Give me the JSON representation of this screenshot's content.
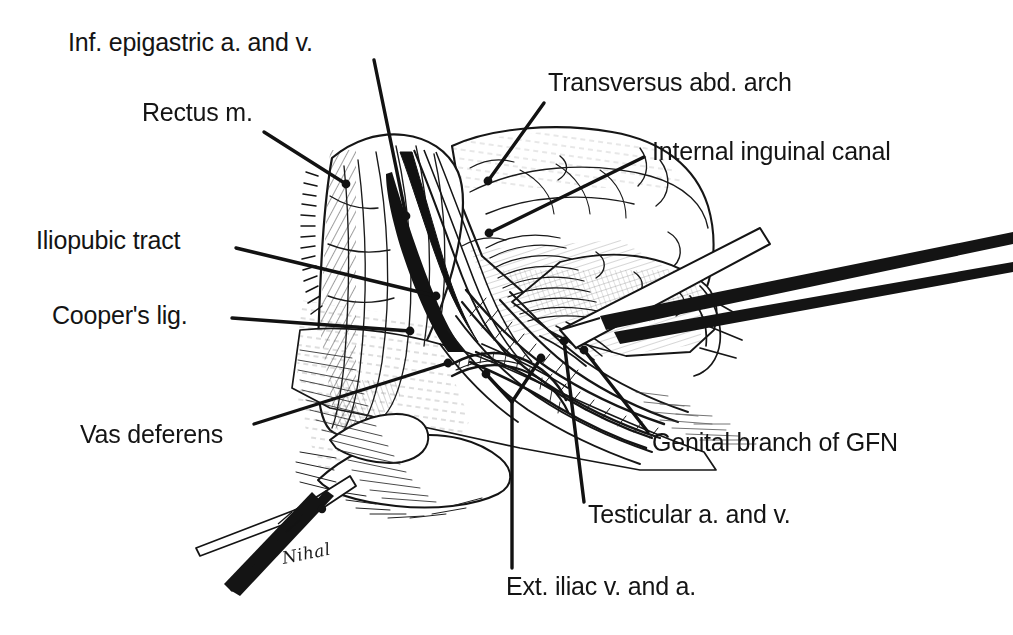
{
  "figure": {
    "type": "anatomical-line-illustration",
    "style": "black-and-white pen-and-ink line art",
    "background_color": "#ffffff",
    "ink_color": "#141414",
    "width": 1013,
    "height": 635,
    "signature": "Nihal"
  },
  "labels": [
    {
      "id": "inf-epigastric",
      "text": "Inf. epigastric a. and v.",
      "x": 68,
      "y": 28,
      "leader": {
        "x1": 374,
        "y1": 60,
        "x2": 406,
        "y2": 216,
        "tip": "dot"
      }
    },
    {
      "id": "rectus",
      "text": "Rectus m.",
      "x": 142,
      "y": 98,
      "leader": {
        "x1": 264,
        "y1": 132,
        "x2": 346,
        "y2": 184,
        "tip": "dot"
      }
    },
    {
      "id": "transversus-arch",
      "text": "Transversus abd. arch",
      "x": 548,
      "y": 68,
      "leader": {
        "x1": 544,
        "y1": 103,
        "x2": 488,
        "y2": 181,
        "tip": "dot"
      }
    },
    {
      "id": "internal-inguinal-canal",
      "text": "Internal inguinal canal",
      "x": 652,
      "y": 137,
      "leader": {
        "x1": 644,
        "y1": 157,
        "x2": 489,
        "y2": 233,
        "tip": "dot"
      }
    },
    {
      "id": "iliopubic-tract",
      "text": "Iliopubic tract",
      "x": 36,
      "y": 226,
      "leader": {
        "x1": 236,
        "y1": 248,
        "x2": 436,
        "y2": 296,
        "tip": "dot"
      }
    },
    {
      "id": "coopers-lig",
      "text": "Cooper's lig.",
      "x": 52,
      "y": 301,
      "leader": {
        "x1": 232,
        "y1": 318,
        "x2": 410,
        "y2": 331,
        "tip": "dot"
      }
    },
    {
      "id": "vas-deferens",
      "text": "Vas deferens",
      "x": 80,
      "y": 420,
      "leader": {
        "x1": 254,
        "y1": 424,
        "x2": 448,
        "y2": 363,
        "tip": "dot"
      }
    },
    {
      "id": "genital-branch-gfn",
      "text": "Genital branch of GFN",
      "x": 652,
      "y": 428,
      "leader": {
        "x1": 648,
        "y1": 432,
        "x2": 584,
        "y2": 350,
        "tip": "dot"
      }
    },
    {
      "id": "testicular",
      "text": "Testicular a. and v.",
      "x": 588,
      "y": 500,
      "leader": {
        "x1": 584,
        "y1": 502,
        "x2": 564,
        "y2": 341,
        "tip": "dot"
      }
    },
    {
      "id": "ext-iliac",
      "text": "Ext. iliac v. and a.",
      "x": 506,
      "y": 572,
      "leader": {
        "x1": 512,
        "y1": 568,
        "x2": 512,
        "y2": 402,
        "tip": "fork"
      },
      "fork": [
        {
          "x": 486,
          "y": 374
        },
        {
          "x": 541,
          "y": 358
        }
      ]
    }
  ],
  "instruments": [
    {
      "id": "retractor-blade",
      "description": "flat retractor blade entering from upper right"
    },
    {
      "id": "grasper-forceps",
      "description": "grasping forceps entering from lower left"
    }
  ]
}
